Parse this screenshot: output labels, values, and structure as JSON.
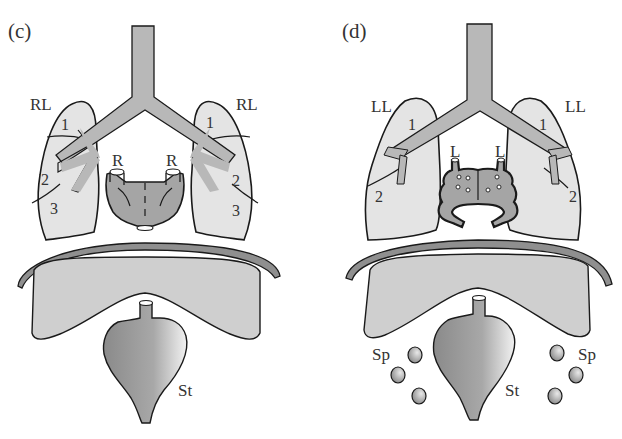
{
  "panels": [
    {
      "id": "c",
      "label": "(c)",
      "lung_left_label": "RL",
      "lung_right_label": "RL",
      "lobes_left": [
        "1",
        "2",
        "3"
      ],
      "lobes_right": [
        "1",
        "2",
        "3"
      ],
      "atrium_left_label": "R",
      "atrium_right_label": "R",
      "stomach_label": "St"
    },
    {
      "id": "d",
      "label": "(d)",
      "lung_left_label": "LL",
      "lung_right_label": "LL",
      "lobes_left": [
        "1",
        "2"
      ],
      "lobes_right": [
        "1",
        "2"
      ],
      "atrium_left_label": "L",
      "atrium_right_label": "L",
      "stomach_label": "St",
      "spleen_left_label": "Sp",
      "spleen_right_label": "Sp"
    }
  ],
  "colors": {
    "lung_fill": "#e4e4e4",
    "airway_fill": "#b8b8b8",
    "heart_fill": "#a5a5a5",
    "liver_fill": "#cfcfcf",
    "diaphragm_fill": "#8f8f8f",
    "stroke": "#1a1a1a"
  }
}
